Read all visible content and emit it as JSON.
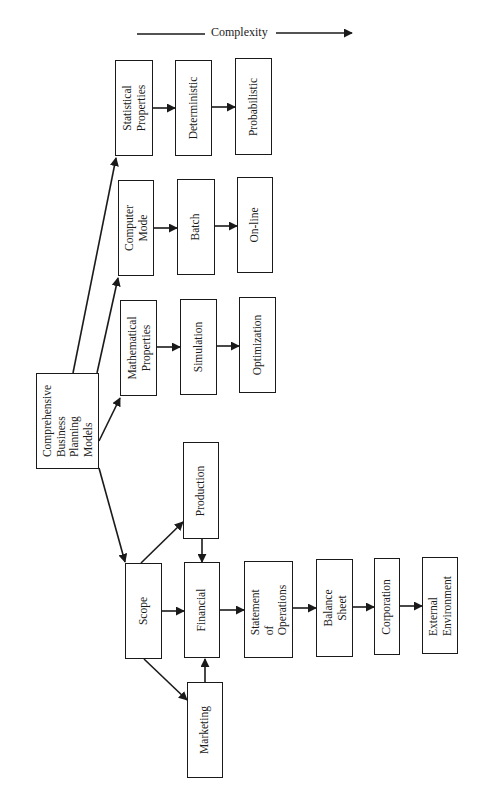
{
  "diagram": {
    "title": "Comprehensive Business Planning Models",
    "axis_label": "Complexity",
    "orientation": "rotated 90deg counter-clockwise",
    "nodes": {
      "root": {
        "label": "Comprehensive\nBusiness\nPlanning\nModels"
      },
      "statistical": {
        "label": "Statistical\nProperties"
      },
      "deterministic": {
        "label": "Deterministic"
      },
      "probabilistic": {
        "label": "Probabilistic"
      },
      "computer_mode": {
        "label": "Computer\nMode"
      },
      "batch": {
        "label": "Batch"
      },
      "online": {
        "label": "On-line"
      },
      "mathematical": {
        "label": "Mathematical\nProperties"
      },
      "simulation": {
        "label": "Simulation"
      },
      "optimization": {
        "label": "Optimization"
      },
      "production": {
        "label": "Production"
      },
      "scope": {
        "label": "Scope"
      },
      "financial": {
        "label": "Financial"
      },
      "marketing": {
        "label": "Marketing"
      },
      "statement": {
        "label": "Statement\nof\nOperations"
      },
      "balance": {
        "label": "Balance\nSheet"
      },
      "corporation": {
        "label": "Corporation"
      },
      "external": {
        "label": "External\nEnvironment"
      }
    },
    "edges": [
      [
        "root",
        "statistical"
      ],
      [
        "root",
        "computer_mode"
      ],
      [
        "root",
        "mathematical"
      ],
      [
        "root",
        "scope"
      ],
      [
        "statistical",
        "deterministic"
      ],
      [
        "deterministic",
        "probabilistic"
      ],
      [
        "computer_mode",
        "batch"
      ],
      [
        "batch",
        "online"
      ],
      [
        "mathematical",
        "simulation"
      ],
      [
        "simulation",
        "optimization"
      ],
      [
        "scope",
        "production"
      ],
      [
        "scope",
        "financial"
      ],
      [
        "scope",
        "marketing"
      ],
      [
        "production",
        "financial"
      ],
      [
        "marketing",
        "financial"
      ],
      [
        "financial",
        "statement"
      ],
      [
        "statement",
        "balance"
      ],
      [
        "balance",
        "corporation"
      ],
      [
        "corporation",
        "external"
      ]
    ],
    "colors": {
      "ink": "#1a1a1a",
      "background": "#ffffff"
    }
  }
}
